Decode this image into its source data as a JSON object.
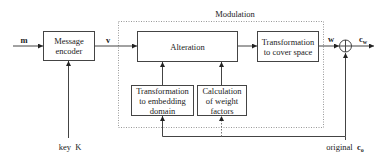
{
  "diagram": {
    "group": {
      "label": "Modulation"
    },
    "blocks": {
      "message_encoder": {
        "line1": "Message",
        "line2": "encoder"
      },
      "alteration": {
        "label": "Alteration"
      },
      "cover_transform": {
        "line1": "Transformation",
        "line2": "to cover space"
      },
      "embedding_transform": {
        "line1": "Transformation",
        "line2": "to embedding",
        "line3": "domain"
      },
      "weight_calc": {
        "line1": "Calculation",
        "line2": "of weight",
        "line3": "factors"
      }
    },
    "signals": {
      "message": "m",
      "encoded": "v",
      "watermark": "w",
      "watermarked": {
        "base": "c",
        "sub": "w"
      },
      "key": {
        "prefix": "key",
        "symbol": "K"
      },
      "original": {
        "prefix": "original",
        "base": "c",
        "sub": "o"
      }
    },
    "adder_symbol": "+",
    "colors": {
      "line": "#333333",
      "dotted": "#999999",
      "text": "#222222"
    }
  }
}
